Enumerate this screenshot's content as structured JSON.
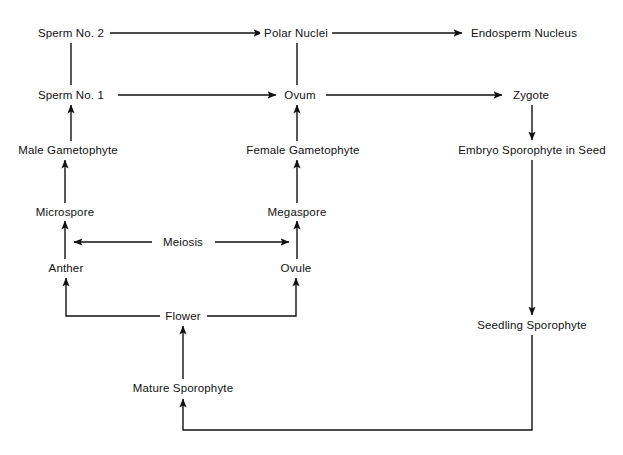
{
  "diagram": {
    "background_color": "#ffffff",
    "line_color": "#111111",
    "text_color": "#111111",
    "nodes": [
      {
        "id": "sperm2",
        "label": "Sperm No. 2",
        "x": 71,
        "y": 33
      },
      {
        "id": "polar",
        "label": "Polar Nuclei",
        "x": 296,
        "y": 33
      },
      {
        "id": "endosperm",
        "label": "Endosperm Nucleus",
        "x": 524,
        "y": 33
      },
      {
        "id": "sperm1",
        "label": "Sperm No. 1",
        "x": 71,
        "y": 95
      },
      {
        "id": "ovum",
        "label": "Ovum",
        "x": 300,
        "y": 95
      },
      {
        "id": "zygote",
        "label": "Zygote",
        "x": 531,
        "y": 95
      },
      {
        "id": "malegam",
        "label": "Male Gametophyte",
        "x": 68,
        "y": 150
      },
      {
        "id": "femgam",
        "label": "Female Gametophyte",
        "x": 303,
        "y": 150
      },
      {
        "id": "embryo",
        "label": "Embryo Sporophyte in Seed",
        "x": 532,
        "y": 150
      },
      {
        "id": "microspore",
        "label": "Microspore",
        "x": 65,
        "y": 212
      },
      {
        "id": "megaspore",
        "label": "Megaspore",
        "x": 297,
        "y": 212
      },
      {
        "id": "meiosis",
        "label": "Meiosis",
        "x": 183,
        "y": 242
      },
      {
        "id": "anther",
        "label": "Anther",
        "x": 66,
        "y": 268
      },
      {
        "id": "ovule",
        "label": "Ovule",
        "x": 296,
        "y": 268
      },
      {
        "id": "flower",
        "label": "Flower",
        "x": 183,
        "y": 316
      },
      {
        "id": "seedling",
        "label": "Seedling Sporophyte",
        "x": 532,
        "y": 325
      },
      {
        "id": "mature",
        "label": "Mature Sporophyte",
        "x": 183,
        "y": 388
      }
    ],
    "edges": [
      {
        "id": "sperm2-to-polar",
        "from": "sperm2",
        "to": "polar",
        "arrow": true
      },
      {
        "id": "polar-to-endosperm",
        "from": "polar",
        "to": "endosperm",
        "arrow": true
      },
      {
        "id": "sperm2-to-sperm1",
        "from": "sperm2",
        "to": "sperm1",
        "arrow": false
      },
      {
        "id": "polar-to-ovum",
        "from": "ovum",
        "to": "polar",
        "arrow": false
      },
      {
        "id": "sperm1-to-ovum",
        "from": "sperm1",
        "to": "ovum",
        "arrow": true
      },
      {
        "id": "ovum-to-zygote",
        "from": "ovum",
        "to": "zygote",
        "arrow": true
      },
      {
        "id": "malegam-to-sperm1",
        "from": "malegam",
        "to": "sperm1",
        "arrow": true
      },
      {
        "id": "femgam-to-ovum",
        "from": "femgam",
        "to": "ovum",
        "arrow": true
      },
      {
        "id": "zygote-to-embryo",
        "from": "zygote",
        "to": "embryo",
        "arrow": true
      },
      {
        "id": "microspore-to-malegam",
        "from": "microspore",
        "to": "malegam",
        "arrow": true
      },
      {
        "id": "megaspore-to-femgam",
        "from": "megaspore",
        "to": "femgam",
        "arrow": true
      },
      {
        "id": "meiosis-to-microspore",
        "from": "meiosis",
        "to": "microspore",
        "arrow": true
      },
      {
        "id": "meiosis-to-megaspore",
        "from": "meiosis",
        "to": "megaspore",
        "arrow": true
      },
      {
        "id": "anther-to-microspore",
        "from": "anther",
        "to": "microspore",
        "arrow": true
      },
      {
        "id": "ovule-to-megaspore",
        "from": "ovule",
        "to": "megaspore",
        "arrow": true
      },
      {
        "id": "flower-to-anther",
        "from": "flower",
        "to": "anther",
        "arrow": true
      },
      {
        "id": "flower-to-ovule",
        "from": "flower",
        "to": "ovule",
        "arrow": true
      },
      {
        "id": "embryo-to-seedling",
        "from": "embryo",
        "to": "seedling",
        "arrow": true
      },
      {
        "id": "mature-to-flower",
        "from": "mature",
        "to": "flower",
        "arrow": true
      },
      {
        "id": "seedling-to-mature",
        "from": "seedling",
        "to": "mature",
        "arrow": true
      }
    ]
  }
}
